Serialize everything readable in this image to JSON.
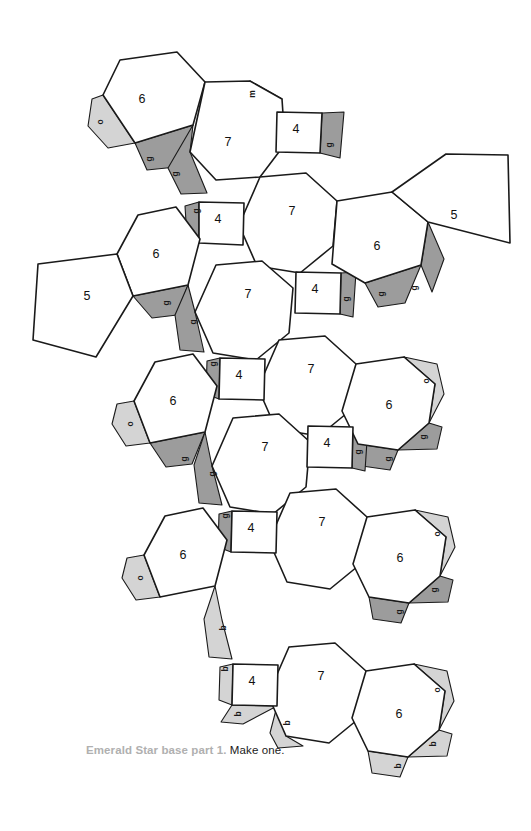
{
  "document": {
    "type": "papercraft-net",
    "caption_title": "Emerald Star base part 1.",
    "caption_rest": " Make one.",
    "background": "#ffffff"
  },
  "legend": {
    "face_stroke": "#1a1a1a",
    "face_fill": "#ffffff",
    "tab_glue_color": "#9c9c9c",
    "tab_other_color": "#d4d4d4"
  },
  "faces": [
    {
      "id": "hex-top-left",
      "label": "6",
      "cx": 142,
      "cy": 100,
      "points": "103,95 120,60 177,52 205,82 193,125 135,143"
    },
    {
      "id": "hep-top",
      "label": "7",
      "cx": 228,
      "cy": 143,
      "points": "205,82 250,81 282,99 285,144 260,177 216,180 190,152"
    },
    {
      "id": "sq-top",
      "label": "4",
      "cx": 296,
      "cy": 130,
      "points": "277,112 322,113 320,153 276,152"
    },
    {
      "id": "hep-upper",
      "label": "7",
      "cx": 292,
      "cy": 212,
      "points": "260,177 306,173 337,201 333,246 300,273 257,266 239,225"
    },
    {
      "id": "sq-upper-left",
      "label": "4",
      "cx": 218,
      "cy": 220,
      "points": "199,202 244,203 243,245 199,243"
    },
    {
      "id": "hex-upper-left",
      "label": "6",
      "cx": 156,
      "cy": 255,
      "points": "117,254 138,215 176,207 200,239 188,285 133,296"
    },
    {
      "id": "pent-left-upper",
      "label": "5",
      "cx": 87,
      "cy": 297,
      "points": "38,264 117,254 133,296 96,357 33,340"
    },
    {
      "id": "hex-upper-right",
      "label": "6",
      "cx": 377,
      "cy": 247,
      "points": "337,201 392,192 428,222 421,265 365,283 332,264"
    },
    {
      "id": "pent-right-upper",
      "label": "5",
      "cx": 454,
      "cy": 216,
      "points": "392,192 446,154 508,155 510,243 428,222"
    },
    {
      "id": "hep-mid-upper",
      "label": "7",
      "cx": 248,
      "cy": 295,
      "points": "216,265 262,261 293,288 289,333 256,360 213,353 195,312"
    },
    {
      "id": "sq-mid-right",
      "label": "4",
      "cx": 315,
      "cy": 290,
      "points": "296,272 341,273 340,314 295,313"
    },
    {
      "id": "hep-mid",
      "label": "7",
      "cx": 311,
      "cy": 370,
      "points": "279,340 325,336 356,364 352,409 319,436 276,429 258,388"
    },
    {
      "id": "sq-mid-left",
      "label": "4",
      "cx": 239,
      "cy": 376,
      "points": "220,358 265,359 264,400 219,399"
    },
    {
      "id": "hex-mid-left",
      "label": "6",
      "cx": 173,
      "cy": 402,
      "points": "134,401 155,362 193,354 217,386 205,432 150,443"
    },
    {
      "id": "hex-mid-right",
      "label": "6",
      "cx": 389,
      "cy": 406,
      "points": "356,364 404,357 435,384 429,423 398,450 358,444 342,411"
    },
    {
      "id": "hep-lower-upper",
      "label": "7",
      "cx": 265,
      "cy": 448,
      "points": "233,418 279,414 310,442 306,487 273,514 230,507 212,466"
    },
    {
      "id": "sq-lower-right",
      "label": "4",
      "cx": 327,
      "cy": 444,
      "points": "308,426 353,427 352,468 307,467"
    },
    {
      "id": "hep-lower",
      "label": "7",
      "cx": 322,
      "cy": 523,
      "points": "290,493 336,489 367,517 363,562 330,589 287,582 269,541"
    },
    {
      "id": "sq-lower-left",
      "label": "4",
      "cx": 251,
      "cy": 529,
      "points": "232,511 277,512 276,553 231,552"
    },
    {
      "id": "hex-lower-left",
      "label": "6",
      "cx": 183,
      "cy": 556,
      "points": "144,555 165,516 203,508 227,540 215,586 160,597"
    },
    {
      "id": "hex-lower-right",
      "label": "6",
      "cx": 400,
      "cy": 559,
      "points": "367,517 415,510 446,537 440,576 409,603 369,597 353,564"
    },
    {
      "id": "hep-bottom",
      "label": "7",
      "cx": 321,
      "cy": 677,
      "points": "289,647 335,643 366,671 362,716 329,743 286,736 268,695"
    },
    {
      "id": "sq-bottom",
      "label": "4",
      "cx": 252,
      "cy": 682,
      "points": "233,664 278,665 277,706 232,705"
    },
    {
      "id": "hex-bottom-right",
      "label": "6",
      "cx": 399,
      "cy": 715,
      "points": "366,671 414,664 445,691 439,730 408,757 368,751 352,718"
    }
  ],
  "tabs": [
    {
      "id": "tab-o-1",
      "kind": "o",
      "label": "o",
      "lx": 101,
      "ly": 122,
      "points": "103,95 135,143 108,148 88,126 92,99"
    },
    {
      "id": "tab-g-1",
      "kind": "g",
      "label": "g",
      "lx": 150,
      "ly": 159,
      "points": "135,143 193,125 176,167 147,170"
    },
    {
      "id": "tab-g-2",
      "kind": "g",
      "label": "g",
      "lx": 176,
      "ly": 174,
      "points": "193,125 190,152 207,193 181,194 168,168"
    },
    {
      "id": "tab-m-1",
      "kind": "m",
      "label": "m",
      "lx": 253,
      "ly": 94,
      "points": "250,81 282,99 277,112 244,110 240,90"
    },
    {
      "id": "tab-g-3",
      "kind": "g",
      "label": "g",
      "lx": 330,
      "ly": 145,
      "points": "322,113 344,112 340,158 320,153"
    },
    {
      "id": "tab-g-4",
      "kind": "g",
      "label": "g",
      "lx": 197,
      "ly": 211,
      "points": "199,202 199,243 187,238 185,206"
    },
    {
      "id": "tab-g-5",
      "kind": "g",
      "label": "g",
      "lx": 167,
      "ly": 303,
      "points": "133,296 188,285 177,315 152,318"
    },
    {
      "id": "tab-g-6",
      "kind": "g",
      "label": "g",
      "lx": 194,
      "ly": 322,
      "points": "188,285 195,312 204,352 180,350 175,315"
    },
    {
      "id": "tab-g-7",
      "kind": "g",
      "label": "g",
      "lx": 382,
      "ly": 294,
      "points": "365,283 421,265 405,303 378,307"
    },
    {
      "id": "tab-g-8",
      "kind": "g",
      "label": "g",
      "lx": 415,
      "ly": 288,
      "points": "421,265 428,222 444,259 432,292"
    },
    {
      "id": "tab-g-9",
      "kind": "g",
      "label": "g",
      "lx": 347,
      "ly": 299,
      "points": "341,273 356,272 353,317 340,314"
    },
    {
      "id": "tab-g-10",
      "kind": "g",
      "label": "g",
      "lx": 214,
      "ly": 364,
      "points": "220,358 219,399 206,394 207,361"
    },
    {
      "id": "tab-o-2",
      "kind": "o",
      "label": "o",
      "lx": 131,
      "ly": 424,
      "points": "134,401 150,443 126,446 112,424 117,404"
    },
    {
      "id": "tab-g-11",
      "kind": "g",
      "label": "g",
      "lx": 185,
      "ly": 459,
      "points": "150,443 205,432 192,464 166,467"
    },
    {
      "id": "tab-o-3",
      "kind": "o",
      "label": "o",
      "lx": 427,
      "ly": 381,
      "points": "404,357 435,384 429,423 444,394 437,364"
    },
    {
      "id": "tab-g-12",
      "kind": "g",
      "label": "g",
      "lx": 389,
      "ly": 459,
      "points": "358,444 398,450 390,470 362,466"
    },
    {
      "id": "tab-g-13",
      "kind": "g",
      "label": "g",
      "lx": 424,
      "ly": 437,
      "points": "429,423 398,450 437,449 442,427"
    },
    {
      "id": "tab-g-14",
      "kind": "g",
      "label": "g",
      "lx": 213,
      "ly": 474,
      "points": "205,432 212,466 222,505 199,503 194,465"
    },
    {
      "id": "tab-g-15",
      "kind": "g",
      "label": "g",
      "lx": 359,
      "ly": 452,
      "points": "353,427 368,426 365,471 352,468"
    },
    {
      "id": "tab-g-16",
      "kind": "g",
      "label": "g",
      "lx": 226,
      "ly": 516,
      "points": "232,511 231,552 218,547 219,514"
    },
    {
      "id": "tab-o-4",
      "kind": "o",
      "label": "o",
      "lx": 141,
      "ly": 578,
      "points": "144,555 160,597 136,600 122,578 127,558"
    },
    {
      "id": "tab-b-1",
      "kind": "b",
      "label": "b",
      "lx": 224,
      "ly": 628,
      "points": "215,586 222,620 232,659 209,657 204,619"
    },
    {
      "id": "tab-o-5",
      "kind": "o",
      "label": "o",
      "lx": 438,
      "ly": 534,
      "points": "415,510 446,537 440,576 455,547 448,517"
    },
    {
      "id": "tab-g-17",
      "kind": "g",
      "label": "g",
      "lx": 400,
      "ly": 612,
      "points": "369,597 409,603 401,623 373,619"
    },
    {
      "id": "tab-g-18",
      "kind": "g",
      "label": "g",
      "lx": 435,
      "ly": 590,
      "points": "440,576 409,603 448,602 453,580"
    },
    {
      "id": "tab-b-2",
      "kind": "b",
      "label": "b",
      "lx": 226,
      "ly": 669,
      "points": "233,664 232,705 219,700 220,667"
    },
    {
      "id": "tab-b-3",
      "kind": "b",
      "label": "b",
      "lx": 239,
      "ly": 714,
      "points": "232,705 277,706 243,724 221,722"
    },
    {
      "id": "tab-b-4",
      "kind": "b",
      "label": "b",
      "lx": 288,
      "ly": 723,
      "points": "277,706 289,647 286,736 303,746 278,748 270,733"
    },
    {
      "id": "tab-o-6",
      "kind": "o",
      "label": "o",
      "lx": 438,
      "ly": 690,
      "points": "414,664 445,691 439,730 454,701 447,671"
    },
    {
      "id": "tab-b-5",
      "kind": "b",
      "label": "b",
      "lx": 399,
      "ly": 766,
      "points": "368,751 408,757 400,777 372,773"
    },
    {
      "id": "tab-b-6",
      "kind": "b",
      "label": "b",
      "lx": 434,
      "ly": 744,
      "points": "439,730 408,757 447,756 452,734"
    }
  ]
}
